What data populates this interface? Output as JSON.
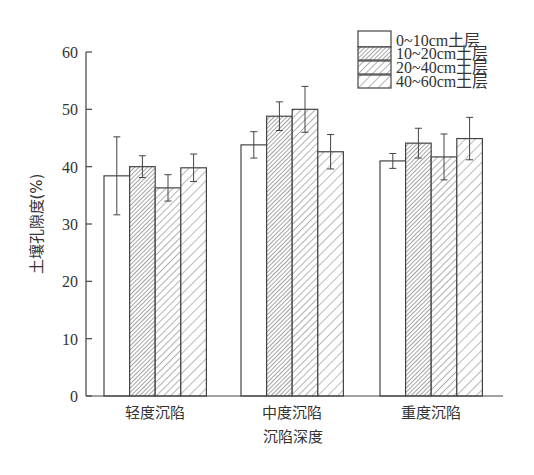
{
  "chart_data": {
    "type": "bar",
    "title": "",
    "xlabel": "沉陷深度",
    "ylabel": "土壤孔隙度(%)",
    "ylim": [
      0,
      60
    ],
    "yticks": [
      0,
      10,
      20,
      30,
      40,
      50,
      60
    ],
    "grid": false,
    "legend_position": "top-right",
    "categories": [
      "轻度沉陷",
      "中度沉陷",
      "重度沉陷"
    ],
    "series": [
      {
        "name": "0~10cm土层",
        "pattern": "none",
        "values": [
          38.4,
          43.8,
          41.0
        ],
        "errors": [
          6.8,
          2.3,
          1.3
        ]
      },
      {
        "name": "10~20cm土层",
        "pattern": "dense-hatch",
        "values": [
          40.0,
          48.8,
          44.1
        ],
        "errors": [
          1.9,
          2.5,
          2.6
        ]
      },
      {
        "name": "20~40cm土层",
        "pattern": "medium-hatch",
        "values": [
          36.3,
          50.0,
          41.7
        ],
        "errors": [
          2.3,
          4.0,
          4.0
        ]
      },
      {
        "name": "40~60cm土层",
        "pattern": "sparse-hatch",
        "values": [
          39.8,
          42.6,
          44.9
        ],
        "errors": [
          2.4,
          3.0,
          3.7
        ]
      }
    ],
    "colors": {
      "stroke": "#444444",
      "fill": "#ffffff",
      "text": "#333333"
    }
  }
}
